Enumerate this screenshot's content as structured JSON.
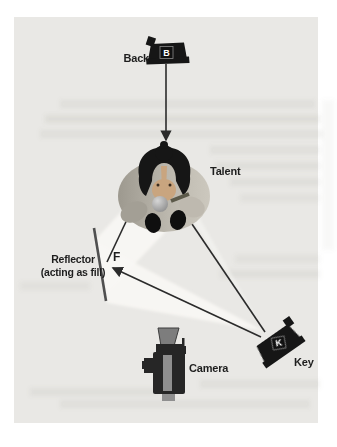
{
  "figure": {
    "panel_color": "#e9e8e5",
    "beam_color": "#f8f7f4",
    "line_color": "#2b2b2b",
    "fixture_color": "#161616",
    "labels": {
      "back": "Back",
      "back_letter": "B",
      "talent": "Talent",
      "reflector_line1": "Reflector",
      "reflector_line2": "(acting as fill)",
      "fill_letter": "F",
      "key": "Key",
      "key_letter": "K",
      "camera": "Camera"
    }
  }
}
